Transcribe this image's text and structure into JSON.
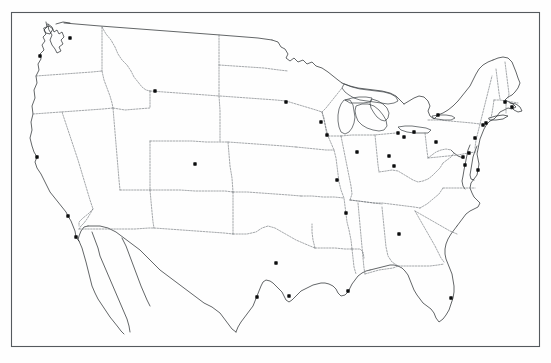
{
  "figure": {
    "title": "",
    "caption": "",
    "kind": "point-location-map",
    "region_label": "Contiguous United States",
    "background_color": "#fefefe",
    "frame_color": "#555a5e",
    "coastline_color": "#2f3336",
    "state_border_color": "#6d7276",
    "marker_color": "#0b0c0d",
    "marker_shape": "square-dot",
    "marker_count": 34,
    "frame": {
      "x": 11,
      "y": 12,
      "width": 529,
      "height": 335
    }
  },
  "chart_data": {
    "type": "scatter",
    "title": "",
    "xlabel": "",
    "ylabel": "",
    "grid": false,
    "legend": "none",
    "projection_note": "map outline of contiguous United States with state boundaries",
    "xlim": [
      11,
      540
    ],
    "ylim": [
      12,
      347
    ],
    "markers": [
      {
        "label": "Seattle",
        "x": 70,
        "y": 38
      },
      {
        "label": "Portland",
        "x": 40,
        "y": 56
      },
      {
        "label": "San Francisco",
        "x": 37,
        "y": 157
      },
      {
        "label": "Los Angeles",
        "x": 68,
        "y": 216
      },
      {
        "label": "San Diego",
        "x": 76,
        "y": 237
      },
      {
        "label": "Salt Lake City",
        "x": 155,
        "y": 91
      },
      {
        "label": "Denver",
        "x": 195,
        "y": 164
      },
      {
        "label": "Minneapolis",
        "x": 286,
        "y": 102
      },
      {
        "label": "Milwaukee",
        "x": 321,
        "y": 122
      },
      {
        "label": "Chicago",
        "x": 327,
        "y": 135
      },
      {
        "label": "Detroit",
        "x": 398,
        "y": 133
      },
      {
        "label": "Cleveland",
        "x": 414,
        "y": 132
      },
      {
        "label": "Toledo",
        "x": 404,
        "y": 137
      },
      {
        "label": "Indianapolis",
        "x": 357,
        "y": 152
      },
      {
        "label": "Cincinnati",
        "x": 389,
        "y": 156
      },
      {
        "label": "St. Louis",
        "x": 337,
        "y": 180
      },
      {
        "label": "Louisville",
        "x": 394,
        "y": 166
      },
      {
        "label": "Pittsburgh",
        "x": 436,
        "y": 142
      },
      {
        "label": "Buffalo",
        "x": 438,
        "y": 115
      },
      {
        "label": "Boston",
        "x": 505,
        "y": 102
      },
      {
        "label": "Providence",
        "x": 512,
        "y": 107
      },
      {
        "label": "New York",
        "x": 486,
        "y": 123
      },
      {
        "label": "Newark",
        "x": 483,
        "y": 125
      },
      {
        "label": "Philadelphia",
        "x": 475,
        "y": 138
      },
      {
        "label": "Baltimore",
        "x": 469,
        "y": 153
      },
      {
        "label": "Washington DC",
        "x": 463,
        "y": 157
      },
      {
        "label": "Richmond",
        "x": 465,
        "y": 165
      },
      {
        "label": "Norfolk",
        "x": 478,
        "y": 170
      },
      {
        "label": "Memphis",
        "x": 346,
        "y": 213
      },
      {
        "label": "Atlanta",
        "x": 399,
        "y": 234
      },
      {
        "label": "New Orleans",
        "x": 348,
        "y": 291
      },
      {
        "label": "Dallas",
        "x": 276,
        "y": 263
      },
      {
        "label": "Houston",
        "x": 289,
        "y": 296
      },
      {
        "label": "San Antonio",
        "x": 257,
        "y": 297
      },
      {
        "label": "Miami",
        "x": 451,
        "y": 298
      }
    ]
  }
}
